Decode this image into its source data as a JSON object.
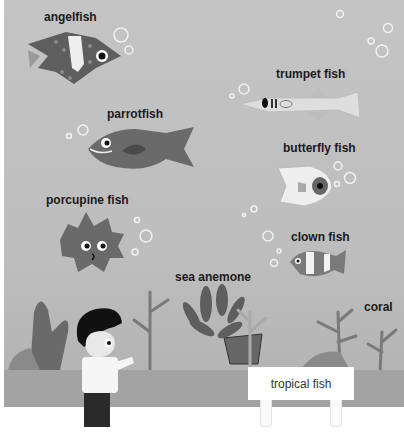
{
  "scene": {
    "title": "tropical fish",
    "sign_text": "tropical fish"
  },
  "labels": {
    "angelfish": "angelfish",
    "trumpet_fish": "trumpet fish",
    "parrotfish": "parrotfish",
    "butterfly_fish": "butterfly fish",
    "porcupine_fish": "porcupine fish",
    "clown_fish": "clown fish",
    "sea_anemone": "sea anemone",
    "coral": "coral"
  },
  "colors": {
    "water": "#c0c0c0",
    "floor": "#a3a3a3",
    "fish_dark": "#5e5e5e",
    "fish_light": "#e8e8e8",
    "label_text": "#1a1a1a"
  }
}
